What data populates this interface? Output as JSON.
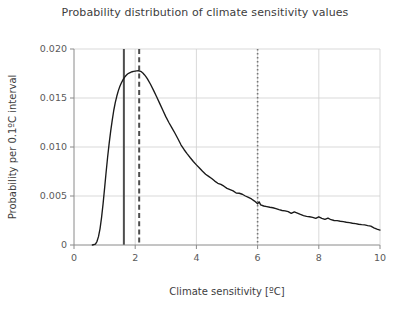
{
  "chart_data": {
    "type": "line",
    "title": "Probability distribution of climate sensitivity values",
    "xlabel": "Climate sensitivity [ºC]",
    "ylabel": "Probability per 0.1ºC interval",
    "xlim": [
      0,
      10
    ],
    "ylim": [
      0,
      0.02
    ],
    "xticks": [
      0,
      2,
      4,
      6,
      8,
      10
    ],
    "xticklabels": [
      "0",
      "2",
      "4",
      "6",
      "8",
      "10"
    ],
    "yticks": [
      0,
      0.005,
      0.01,
      0.015,
      0.02
    ],
    "yticklabels": [
      "0",
      "0.005",
      "0.010",
      "0.015",
      "0.020"
    ],
    "grid": true,
    "grid_color": "#cfcfcf",
    "legend": null,
    "line_color": "#1a1a1a",
    "series": [
      {
        "name": "Probability density",
        "x": [
          0.6,
          0.7,
          0.75,
          0.8,
          0.85,
          0.9,
          0.95,
          1.0,
          1.05,
          1.1,
          1.15,
          1.2,
          1.25,
          1.3,
          1.35,
          1.4,
          1.45,
          1.5,
          1.55,
          1.6,
          1.65,
          1.7,
          1.75,
          1.8,
          1.85,
          1.9,
          1.95,
          2.0,
          2.05,
          2.1,
          2.15,
          2.2,
          2.25,
          2.3,
          2.35,
          2.4,
          2.5,
          2.6,
          2.7,
          2.8,
          2.9,
          3.0,
          3.1,
          3.2,
          3.3,
          3.4,
          3.5,
          3.6,
          3.7,
          3.8,
          3.9,
          4.0,
          4.1,
          4.2,
          4.3,
          4.4,
          4.5,
          4.6,
          4.7,
          4.8,
          4.9,
          5.0,
          5.1,
          5.2,
          5.3,
          5.4,
          5.5,
          5.6,
          5.7,
          5.8,
          5.9,
          6.0,
          6.05,
          6.1,
          6.2,
          6.3,
          6.4,
          6.5,
          6.6,
          6.7,
          6.8,
          6.9,
          7.0,
          7.1,
          7.2,
          7.3,
          7.4,
          7.5,
          7.6,
          7.7,
          7.8,
          7.9,
          8.0,
          8.1,
          8.2,
          8.3,
          8.4,
          8.5,
          8.6,
          8.7,
          8.8,
          8.9,
          9.0,
          9.1,
          9.2,
          9.3,
          9.4,
          9.5,
          9.6,
          9.7,
          9.8,
          9.9,
          10.0
        ],
        "y": [
          0.0,
          0.0001,
          0.00035,
          0.00085,
          0.00165,
          0.0028,
          0.0042,
          0.0058,
          0.00745,
          0.009,
          0.0104,
          0.01165,
          0.01275,
          0.01375,
          0.01455,
          0.0152,
          0.01575,
          0.0162,
          0.01655,
          0.01685,
          0.0171,
          0.0173,
          0.01745,
          0.01755,
          0.01762,
          0.01768,
          0.01772,
          0.01775,
          0.01777,
          0.01778,
          0.01775,
          0.01768,
          0.01755,
          0.01738,
          0.01718,
          0.01695,
          0.0164,
          0.01578,
          0.01512,
          0.01445,
          0.01378,
          0.0131,
          0.0125,
          0.01195,
          0.0114,
          0.01082,
          0.0102,
          0.00972,
          0.0093,
          0.0089,
          0.00852,
          0.00818,
          0.00785,
          0.00752,
          0.00722,
          0.007,
          0.00678,
          0.00652,
          0.0063,
          0.00618,
          0.006,
          0.00578,
          0.00565,
          0.00552,
          0.0053,
          0.00528,
          0.00518,
          0.005,
          0.00485,
          0.0047,
          0.00448,
          0.0042,
          0.0044,
          0.0041,
          0.00398,
          0.00392,
          0.00385,
          0.0038,
          0.00372,
          0.0036,
          0.00352,
          0.00348,
          0.0034,
          0.00322,
          0.00338,
          0.00325,
          0.00312,
          0.003,
          0.00292,
          0.00288,
          0.00282,
          0.00272,
          0.00288,
          0.00272,
          0.00262,
          0.00275,
          0.00258,
          0.0025,
          0.00248,
          0.00242,
          0.00238,
          0.00232,
          0.00228,
          0.00222,
          0.00218,
          0.00212,
          0.00208,
          0.00205,
          0.00198,
          0.00192,
          0.00175,
          0.00162,
          0.00152
        ]
      }
    ],
    "annotations": [
      {
        "name": "solid-vline",
        "style": "solid",
        "x": 1.63,
        "color": "#4d4d4d",
        "width": 2.0
      },
      {
        "name": "dashed-vline",
        "style": "dashed",
        "x": 2.13,
        "color": "#4d4d4d",
        "width": 2.0
      },
      {
        "name": "dotted-vline",
        "style": "dotted",
        "x": 6.0,
        "color": "#777777",
        "width": 1.6
      }
    ]
  }
}
